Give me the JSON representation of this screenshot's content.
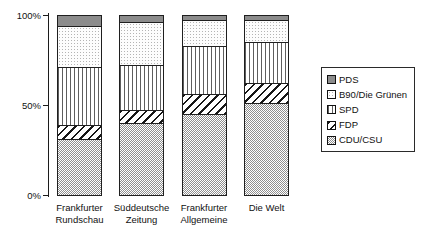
{
  "chart_data": {
    "type": "bar",
    "variant": "stacked-100",
    "orientation": "vertical",
    "title": "",
    "xlabel": "",
    "ylabel": "",
    "ylim": [
      0,
      100
    ],
    "grid": false,
    "yticks": [
      {
        "label": "0%",
        "value": 0
      },
      {
        "label": "50%",
        "value": 50
      },
      {
        "label": "100%",
        "value": 100
      }
    ],
    "categories": [
      {
        "label": "Frankfurter Rundschau",
        "lines": [
          "Frankfurter",
          "Rundschau"
        ]
      },
      {
        "label": "Süddeutsche Zeitung",
        "lines": [
          "Süddeutsche",
          "Zeitung"
        ]
      },
      {
        "label": "Frankfurter Allgemeine",
        "lines": [
          "Frankfurter",
          "Allgemeine"
        ]
      },
      {
        "label": "Die Welt",
        "lines": [
          "Die Welt"
        ]
      }
    ],
    "series": [
      {
        "name": "CDU/CSU",
        "pattern": "checker",
        "values": [
          31,
          40,
          45,
          51
        ]
      },
      {
        "name": "FDP",
        "pattern": "diag",
        "values": [
          8,
          7,
          11,
          11
        ]
      },
      {
        "name": "SPD",
        "pattern": "vlines",
        "values": [
          32,
          25,
          27,
          23
        ]
      },
      {
        "name": "B90/Die Grünen",
        "pattern": "dots",
        "values": [
          23,
          24,
          14,
          12
        ]
      },
      {
        "name": "PDS",
        "pattern": "solid",
        "values": [
          6,
          4,
          3,
          3
        ]
      }
    ],
    "legend": {
      "position": "right",
      "entries": [
        "PDS",
        "B90/Die Grünen",
        "SPD",
        "FDP",
        "CDU/CSU"
      ]
    }
  },
  "colors": {
    "background": "#ffffff",
    "axis": "#1c1c1c",
    "segment_border": "#1f1f1f",
    "solid_gray": "#8c8c8c",
    "hatch_line": "#161616",
    "checker_gray": "#8f8f8f",
    "text": "#111111"
  }
}
